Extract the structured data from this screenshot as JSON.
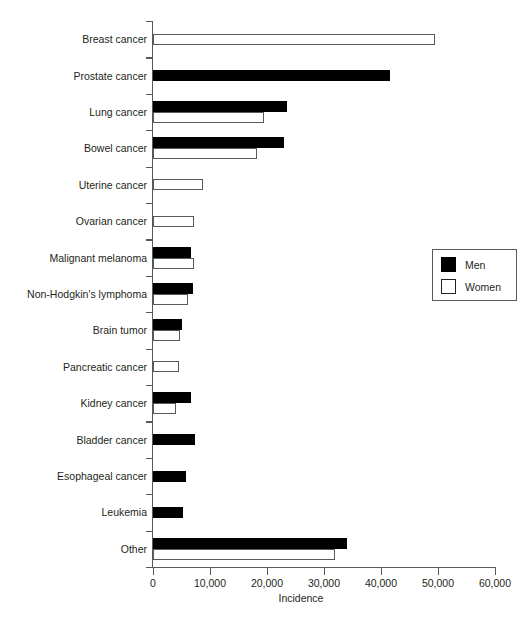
{
  "chart_data": {
    "type": "bar",
    "orientation": "horizontal",
    "title": "",
    "xlabel": "Incidence",
    "ylabel": "",
    "xlim": [
      0,
      60000
    ],
    "xticks": [
      0,
      10000,
      20000,
      30000,
      40000,
      50000,
      60000
    ],
    "xtick_labels": [
      "0",
      "10,000",
      "20,000",
      "30,000",
      "40,000",
      "50,000",
      "60,000"
    ],
    "grid": false,
    "legend_position": "right-middle",
    "categories": [
      "Breast cancer",
      "Prostate cancer",
      "Lung cancer",
      "Bowel cancer",
      "Uterine cancer",
      "Ovarian cancer",
      "Malignant melanoma",
      "Non-Hodgkin's lymphoma",
      "Brain tumor",
      "Pancreatic cancer",
      "Kidney cancer",
      "Bladder cancer",
      "Esophageal cancer",
      "Leukemia",
      "Other"
    ],
    "series": [
      {
        "name": "Men",
        "color": "#000000",
        "values": [
          0,
          41500,
          23500,
          23000,
          0,
          0,
          6700,
          7000,
          5000,
          0,
          6700,
          7400,
          5800,
          5200,
          34000
        ]
      },
      {
        "name": "Women",
        "color": "#ffffff",
        "values": [
          49500,
          0,
          19500,
          18300,
          8700,
          7200,
          7200,
          6200,
          4700,
          4500,
          4000,
          0,
          0,
          0,
          32000
        ]
      }
    ]
  },
  "legend": {
    "entries": [
      {
        "label": "Men",
        "swatch": "black-square"
      },
      {
        "label": "Women",
        "swatch": "white-square"
      }
    ]
  }
}
